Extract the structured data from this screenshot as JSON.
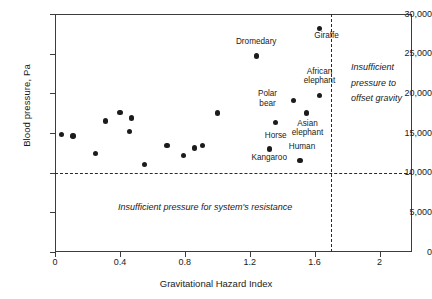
{
  "chart_data": {
    "type": "scatter",
    "title": "",
    "xlabel": "Gravitational Hazard Index",
    "ylabel": "Blood pressure, Pa",
    "xlim": [
      0,
      2.2
    ],
    "ylim": [
      0,
      30000
    ],
    "xticks": [
      0,
      0.4,
      0.8,
      1.2,
      1.6,
      2
    ],
    "xticklabels": [
      "0",
      "0.4",
      "0.8",
      "1.2",
      "1.6",
      "2"
    ],
    "yticks": [
      0,
      5000,
      10000,
      15000,
      20000,
      25000,
      30000
    ],
    "yticklabels": [
      "0",
      "5,000",
      "10,000",
      "15,000",
      "20,000",
      "25,000",
      "30,000"
    ],
    "grid": false,
    "legend": null,
    "reference_lines": [
      {
        "orientation": "horizontal",
        "value": 10000,
        "style": "dashed"
      },
      {
        "orientation": "vertical",
        "value": 1.7,
        "style": "dashed"
      }
    ],
    "points": [
      {
        "label": "",
        "x": 0.04,
        "y": 14800
      },
      {
        "label": "",
        "x": 0.11,
        "y": 14600
      },
      {
        "label": "",
        "x": 0.25,
        "y": 12400
      },
      {
        "label": "",
        "x": 0.31,
        "y": 16500
      },
      {
        "label": "",
        "x": 0.4,
        "y": 17600
      },
      {
        "label": "",
        "x": 0.47,
        "y": 16900
      },
      {
        "label": "",
        "x": 0.46,
        "y": 15200
      },
      {
        "label": "",
        "x": 0.55,
        "y": 11000
      },
      {
        "label": "",
        "x": 0.69,
        "y": 13400
      },
      {
        "label": "",
        "x": 0.79,
        "y": 12200
      },
      {
        "label": "",
        "x": 0.86,
        "y": 13100
      },
      {
        "label": "",
        "x": 0.91,
        "y": 13400
      },
      {
        "label": "",
        "x": 1.0,
        "y": 17500
      },
      {
        "label": "Horse",
        "x": 1.36,
        "y": 16300,
        "label_dx": 0,
        "label_dy": 13
      },
      {
        "label": "Polar bear",
        "x": 1.47,
        "y": 19100,
        "label_dx": -26,
        "label_dy": -6
      },
      {
        "label": "Asian elephant",
        "x": 1.55,
        "y": 17500,
        "label_dx": 1,
        "label_dy": 11
      },
      {
        "label": "African elephant",
        "x": 1.63,
        "y": 19700,
        "label_dx": 0,
        "label_dy": -24
      },
      {
        "label": "Dromedary",
        "x": 1.24,
        "y": 24700,
        "label_dx": 0,
        "label_dy": -14
      },
      {
        "label": "Giraffe",
        "x": 1.63,
        "y": 28200,
        "label_dx": 7,
        "label_dy": 8
      },
      {
        "label": "Kangaroo",
        "x": 1.32,
        "y": 13000,
        "label_dx": 0,
        "label_dy": 9
      },
      {
        "label": "Human",
        "x": 1.51,
        "y": 11500,
        "label_dx": 2,
        "label_dy": -14
      }
    ],
    "annotations": [
      {
        "name": "insufficient-pressure-offset-gravity",
        "text": "Insufficient pressure to offset gravity"
      },
      {
        "name": "insufficient-pressure-system-resistance",
        "text": "Insufficient pressure for system's resistance"
      }
    ],
    "colors": {
      "point": "#1c1c1c",
      "axis": "#3c3c3c",
      "dashed_line": "#2a2a2a",
      "text": "#1a1a1a",
      "background": "#ffffff"
    }
  }
}
